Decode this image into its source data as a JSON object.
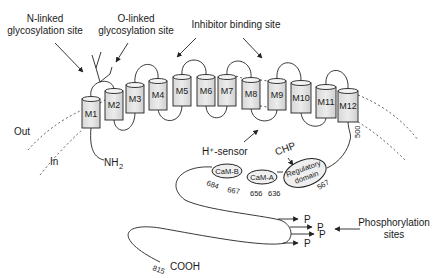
{
  "labels": {
    "n_linked": [
      "N-linked",
      "glycosylation site"
    ],
    "o_linked": [
      "O-linked",
      "glycosylation site"
    ],
    "inhibitor": "Inhibitor binding site",
    "out": "Out",
    "in": "In",
    "nh2": "NH",
    "nh2_sub": "2",
    "h_sensor": "H⁺-sensor",
    "chp": "CHP",
    "cooh": "COOH",
    "phospho": [
      "Phosphorylation",
      "sites"
    ],
    "p": "P"
  },
  "segments": [
    "M1",
    "M2",
    "M3",
    "M4",
    "M5",
    "M6",
    "M7",
    "M8",
    "M9",
    "M10",
    "M11",
    "M12"
  ],
  "domains": {
    "camb": "CaM-B",
    "cama": "CaM-A",
    "regulatory": [
      "Regulatory",
      "domain"
    ]
  },
  "residues": {
    "r500": "500",
    "r684": "684",
    "r667": "667",
    "r656": "656",
    "r636": "636",
    "r567": "567",
    "r815": "815"
  }
}
